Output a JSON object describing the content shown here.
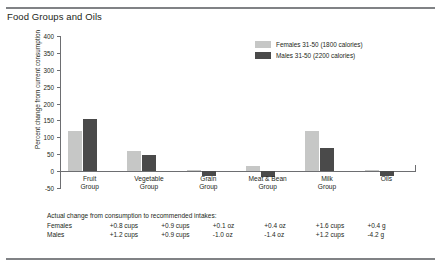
{
  "figure": {
    "title": "Food Groups and Oils"
  },
  "legend": {
    "position": "top-right",
    "entries": [
      {
        "label": "Females 31-50 (1800 calories)",
        "color": "#c6c7c6"
      },
      {
        "label": "Males 31-50 (2200 calories)",
        "color": "#4a4a4a"
      }
    ]
  },
  "footnote": {
    "caption": "Actual change from consumption to recommended intakes:",
    "rows": [
      {
        "label": "Females",
        "values": [
          "+0.8 cups",
          "+0.9 cups",
          "+0.1 oz",
          "+0.4 oz",
          "+1.6 cups",
          "+0.4 g"
        ]
      },
      {
        "label": "Males",
        "values": [
          "+1.2 cups",
          "+0.9 cups",
          "-1.0 oz",
          "-1.4 oz",
          "+1.2 cups",
          "-4.2 g"
        ]
      }
    ]
  },
  "chart_data": {
    "type": "bar",
    "title": "Food Groups and Oils",
    "xlabel": "",
    "ylabel": "Percent change from current consumption",
    "ylim": [
      -50,
      400
    ],
    "yticks": [
      -50,
      0,
      50,
      100,
      150,
      200,
      250,
      300,
      350,
      400
    ],
    "grid": false,
    "categories": [
      "Fruit Group",
      "Vegetable Group",
      "Grain Group",
      "Meat & Bean Group",
      "Milk Group",
      "Oils"
    ],
    "series": [
      {
        "name": "Females 31-50 (1800 calories)",
        "color": "#c6c7c6",
        "values": [
          120,
          60,
          4,
          16,
          120,
          2
        ]
      },
      {
        "name": "Males 31-50 (2200 calories)",
        "color": "#4a4a4a",
        "values": [
          155,
          48,
          -14,
          -18,
          68,
          -13
        ]
      }
    ]
  }
}
